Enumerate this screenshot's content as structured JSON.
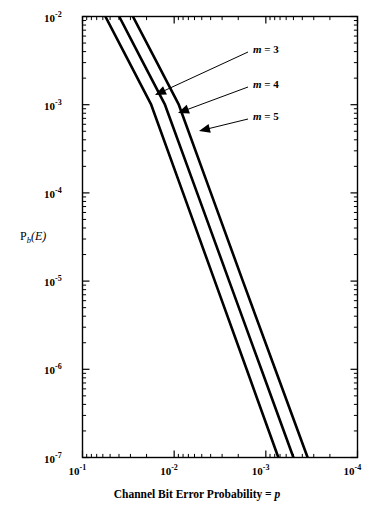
{
  "chart_data": {
    "type": "line",
    "title": "",
    "xlabel": "Channel Bit Error Probability = p",
    "ylabel": "P_b(E)",
    "xscale": "log",
    "yscale": "log",
    "xlim": [
      0.1,
      0.0001
    ],
    "ylim": [
      1e-07,
      0.01
    ],
    "x_reversed": true,
    "grid": false,
    "legend": "annotations-with-arrows",
    "xticklabels": [
      "10-1",
      "10-2",
      "10-3",
      "10-4"
    ],
    "xtick_values": [
      0.1,
      0.01,
      0.001,
      0.0001
    ],
    "yticklabels": [
      "10-2",
      "10-3",
      "10-4",
      "10-5",
      "10-6",
      "10-7"
    ],
    "ytick_values": [
      0.01,
      0.001,
      0.0001,
      1e-05,
      1e-06,
      1e-07
    ],
    "minor_ticks": true,
    "series": [
      {
        "name": "m = 3",
        "label": "m = 3",
        "color": "#000000",
        "linewidth": 2.6,
        "points": [
          {
            "x": 0.0563,
            "y": 0.01
          },
          {
            "x": 0.0316,
            "y": 0.00316
          },
          {
            "x": 0.0178,
            "y": 0.001
          },
          {
            "x": 0.008,
            "y": 0.0001
          },
          {
            "x": 0.0036,
            "y": 1e-05
          },
          {
            "x": 0.00162,
            "y": 1e-06
          },
          {
            "x": 0.00073,
            "y": 1e-07
          }
        ]
      },
      {
        "name": "m = 4",
        "label": "m = 4",
        "color": "#000000",
        "linewidth": 2.6,
        "points": [
          {
            "x": 0.0398,
            "y": 0.01
          },
          {
            "x": 0.0224,
            "y": 0.00316
          },
          {
            "x": 0.0126,
            "y": 0.001
          },
          {
            "x": 0.00562,
            "y": 0.0001
          },
          {
            "x": 0.00251,
            "y": 1e-05
          },
          {
            "x": 0.00112,
            "y": 1e-06
          },
          {
            "x": 0.0005,
            "y": 1e-07
          }
        ]
      },
      {
        "name": "m = 5",
        "label": "m = 5",
        "color": "#000000",
        "linewidth": 2.6,
        "points": [
          {
            "x": 0.0282,
            "y": 0.01
          },
          {
            "x": 0.0158,
            "y": 0.00316
          },
          {
            "x": 0.0089,
            "y": 0.001
          },
          {
            "x": 0.00398,
            "y": 0.0001
          },
          {
            "x": 0.00178,
            "y": 1e-05
          },
          {
            "x": 0.00079,
            "y": 1e-06
          },
          {
            "x": 0.00035,
            "y": 1e-07
          }
        ]
      }
    ],
    "annotations": [
      {
        "label": "m = 3",
        "text_x": 253,
        "text_y": 50,
        "arrow_from_x": 248,
        "arrow_from_y": 52,
        "arrow_to_x": 155,
        "arrow_to_y": 95
      },
      {
        "label": "m = 4",
        "text_x": 253,
        "text_y": 85,
        "arrow_from_x": 248,
        "arrow_from_y": 87,
        "arrow_to_x": 178,
        "arrow_to_y": 113
      },
      {
        "label": "m = 5",
        "text_x": 253,
        "text_y": 117,
        "arrow_from_x": 248,
        "arrow_from_y": 119,
        "arrow_to_x": 199,
        "arrow_to_y": 131
      }
    ]
  },
  "axes": {
    "x_title": "Channel Bit Error Probability = p",
    "x_title_plain": "Channel Bit Error Probability =",
    "x_title_italic": "p",
    "y_title_base": "P",
    "y_title_sub": "b",
    "y_title_tail": "(E)",
    "x_ticks": [
      {
        "mantissa": "10",
        "exp": "-1"
      },
      {
        "mantissa": "10",
        "exp": "-2"
      },
      {
        "mantissa": "10",
        "exp": "-3"
      },
      {
        "mantissa": "10",
        "exp": "-4"
      }
    ],
    "y_ticks": [
      {
        "mantissa": "10",
        "exp": "-2"
      },
      {
        "mantissa": "10",
        "exp": "-3"
      },
      {
        "mantissa": "10",
        "exp": "-4"
      },
      {
        "mantissa": "10",
        "exp": "-5"
      },
      {
        "mantissa": "10",
        "exp": "-6"
      },
      {
        "mantissa": "10",
        "exp": "-7"
      }
    ]
  },
  "style": {
    "frame_color": "#000000",
    "curve_color": "#000000",
    "background": "#ffffff"
  }
}
